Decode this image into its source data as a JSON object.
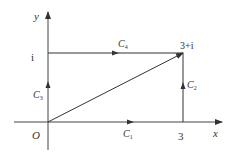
{
  "diagram": {
    "axes": {
      "x_label": "x",
      "y_label": "y",
      "origin_label": "O"
    },
    "points": {
      "x_tick": "3",
      "y_tick": "i",
      "corner": "3+i"
    },
    "paths": [
      {
        "name": "C1",
        "base": "C",
        "sub": "1",
        "from": "0",
        "to": "3"
      },
      {
        "name": "C2",
        "base": "C",
        "sub": "2",
        "from": "3",
        "to": "3+i"
      },
      {
        "name": "C3",
        "base": "C",
        "sub": "3",
        "from": "0",
        "to": "i"
      },
      {
        "name": "C4",
        "base": "C",
        "sub": "4",
        "from": "i",
        "to": "3+i"
      }
    ],
    "colors": {
      "line": "#333333"
    }
  }
}
